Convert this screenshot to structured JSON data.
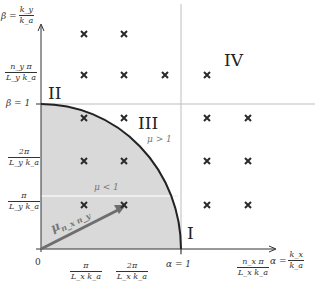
{
  "axes": {
    "x_label": {
      "lhs": "α =",
      "num": "k_x",
      "den": "k_a"
    },
    "y_label": {
      "lhs": "β =",
      "num": "k_y",
      "den": "k_a"
    },
    "origin": "0",
    "x_ticks": [
      {
        "num": "π",
        "den": "L_x k_a"
      },
      {
        "num": "2π",
        "den": "L_x k_a"
      },
      {
        "label": "α = 1"
      },
      {
        "num": "n_x π",
        "den": "L_x k_a"
      }
    ],
    "y_ticks": [
      {
        "num": "π",
        "den": "L_y k_a"
      },
      {
        "num": "2π",
        "den": "L_y k_a"
      },
      {
        "label": "β = 1"
      },
      {
        "num": "n_y π",
        "den": "L_y k_a"
      }
    ]
  },
  "regions": {
    "I": "I",
    "II": "II",
    "III": "III",
    "IV": "IV"
  },
  "annotations": {
    "mu_gt": "μ > 1",
    "mu_lt": "μ < 1",
    "vector": "μ",
    "vector_sub": "n_x n_y"
  },
  "colors": {
    "shade": "#d9d9d9",
    "arc": "#222222",
    "vector": "#6e6e6e",
    "grid_line": "#bdbdbd",
    "marker": "#2a2a2a"
  },
  "markers": [
    [
      84,
      34
    ],
    [
      124,
      34
    ],
    [
      84,
      75
    ],
    [
      124,
      75
    ],
    [
      165,
      75
    ],
    [
      207,
      75
    ],
    [
      84,
      118
    ],
    [
      124,
      118
    ],
    [
      207,
      118
    ],
    [
      248,
      118
    ],
    [
      84,
      161
    ],
    [
      124,
      161
    ],
    [
      207,
      161
    ],
    [
      248,
      161
    ],
    [
      84,
      205
    ],
    [
      124,
      205
    ],
    [
      207,
      205
    ],
    [
      248,
      205
    ]
  ]
}
